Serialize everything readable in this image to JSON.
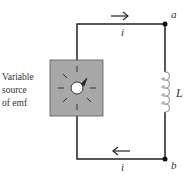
{
  "diagram": {
    "source_label_lines": [
      "Variable",
      "source",
      "of emf"
    ],
    "node_a": "a",
    "node_b": "b",
    "inductor_label": "L",
    "current_top": "i",
    "current_bottom": "i"
  },
  "colors": {
    "wire": "#222222",
    "box_fill": "#a8a8a8",
    "inductor": "#b0b0b0"
  }
}
